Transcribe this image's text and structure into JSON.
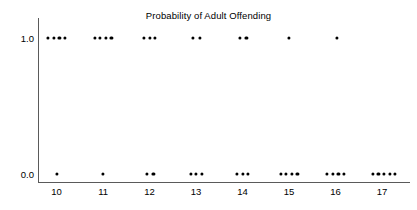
{
  "chart_data": {
    "type": "scatter",
    "title": "Probability of Adult Offending",
    "xlabel": "",
    "ylabel": "",
    "x_tick_labels": [
      "10",
      "11",
      "12",
      "13",
      "14",
      "15",
      "16",
      "17"
    ],
    "y_tick_labels": [
      "1.0",
      "0.0"
    ],
    "y_tick_values": [
      1.0,
      0.0
    ],
    "xlim": [
      9.6,
      17.6
    ],
    "ylim": [
      0.0,
      1.0
    ],
    "grid": false,
    "legend": "none",
    "marker": "filled-circle",
    "marker_color": "#000000",
    "groups": [
      {
        "x": 10,
        "count_at_1": 4,
        "count_at_0": 1
      },
      {
        "x": 11,
        "count_at_1": 4,
        "count_at_0": 1
      },
      {
        "x": 12,
        "count_at_1": 3,
        "count_at_0": 2
      },
      {
        "x": 13,
        "count_at_1": 2,
        "count_at_0": 3
      },
      {
        "x": 14,
        "count_at_1": 2,
        "count_at_0": 3
      },
      {
        "x": 15,
        "count_at_1": 1,
        "count_at_0": 4
      },
      {
        "x": 16,
        "count_at_1": 1,
        "count_at_0": 4
      },
      {
        "x": 17,
        "count_at_1": 0,
        "count_at_0": 5
      }
    ],
    "points": [
      {
        "x": 9.82,
        "y": 1.0
      },
      {
        "x": 9.94,
        "y": 1.0
      },
      {
        "x": 10.06,
        "y": 1.0
      },
      {
        "x": 10.18,
        "y": 1.0
      },
      {
        "x": 10.82,
        "y": 1.0
      },
      {
        "x": 10.94,
        "y": 1.0
      },
      {
        "x": 11.06,
        "y": 1.0
      },
      {
        "x": 11.18,
        "y": 1.0
      },
      {
        "x": 11.88,
        "y": 1.0
      },
      {
        "x": 12.0,
        "y": 1.0
      },
      {
        "x": 12.12,
        "y": 1.0
      },
      {
        "x": 12.94,
        "y": 1.0
      },
      {
        "x": 13.08,
        "y": 1.0
      },
      {
        "x": 13.94,
        "y": 1.0
      },
      {
        "x": 14.08,
        "y": 1.0
      },
      {
        "x": 15.0,
        "y": 1.0
      },
      {
        "x": 16.02,
        "y": 1.0
      },
      {
        "x": 10.0,
        "y": 0.0
      },
      {
        "x": 11.0,
        "y": 0.0
      },
      {
        "x": 11.94,
        "y": 0.0
      },
      {
        "x": 12.08,
        "y": 0.0
      },
      {
        "x": 12.88,
        "y": 0.0
      },
      {
        "x": 13.0,
        "y": 0.0
      },
      {
        "x": 13.12,
        "y": 0.0
      },
      {
        "x": 13.88,
        "y": 0.0
      },
      {
        "x": 14.0,
        "y": 0.0
      },
      {
        "x": 14.12,
        "y": 0.0
      },
      {
        "x": 14.82,
        "y": 0.0
      },
      {
        "x": 14.94,
        "y": 0.0
      },
      {
        "x": 15.06,
        "y": 0.0
      },
      {
        "x": 15.18,
        "y": 0.0
      },
      {
        "x": 15.82,
        "y": 0.0
      },
      {
        "x": 15.94,
        "y": 0.0
      },
      {
        "x": 16.06,
        "y": 0.0
      },
      {
        "x": 16.18,
        "y": 0.0
      },
      {
        "x": 16.8,
        "y": 0.0
      },
      {
        "x": 16.92,
        "y": 0.0
      },
      {
        "x": 17.04,
        "y": 0.0
      },
      {
        "x": 17.16,
        "y": 0.0
      },
      {
        "x": 17.28,
        "y": 0.0
      }
    ]
  },
  "colors": {
    "axis": "#5a5a5a",
    "marker": "#000000",
    "background": "#ffffff",
    "text": "#000000"
  }
}
